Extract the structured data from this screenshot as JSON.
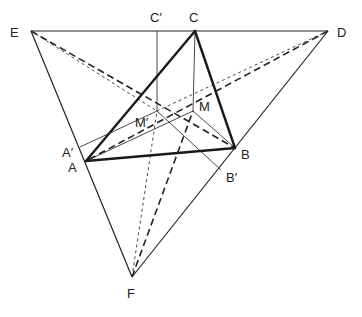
{
  "diagram": {
    "type": "geometry-construction",
    "points": {
      "E": {
        "label": "E",
        "x": 31,
        "y": 31
      },
      "D": {
        "label": "D",
        "x": 328,
        "y": 31
      },
      "F": {
        "label": "F",
        "x": 132,
        "y": 277
      },
      "C": {
        "label": "C",
        "x": 195,
        "y": 31
      },
      "C_prime": {
        "label": "C′",
        "x": 157,
        "y": 31
      },
      "A": {
        "label": "A",
        "x": 86,
        "y": 161
      },
      "A_prime": {
        "label": "A′",
        "x": 80,
        "y": 147
      },
      "B": {
        "label": "B",
        "x": 235,
        "y": 148
      },
      "B_prime": {
        "label": "B′",
        "x": 221,
        "y": 170
      },
      "M": {
        "label": "M",
        "x": 193,
        "y": 111
      },
      "M_prime": {
        "label": "M′",
        "x": 157,
        "y": 111
      }
    },
    "labels": {
      "E": "E",
      "D": "D",
      "F": "F",
      "C": "C",
      "C_prime": "C′",
      "A": "A",
      "A_prime": "A′",
      "B": "B",
      "B_prime": "B′",
      "M": "M",
      "M_prime": "M′"
    },
    "outer_triangle": [
      "E",
      "D",
      "F"
    ],
    "inner_triangle": [
      "A",
      "B",
      "C"
    ],
    "line_styles": {
      "thick": "triangle ABC",
      "thin": "triangle EDF and construction lines",
      "heavy_dashed": "lines from E, D, F to M",
      "light_dashed": "lines from E, D, F to M′"
    }
  }
}
